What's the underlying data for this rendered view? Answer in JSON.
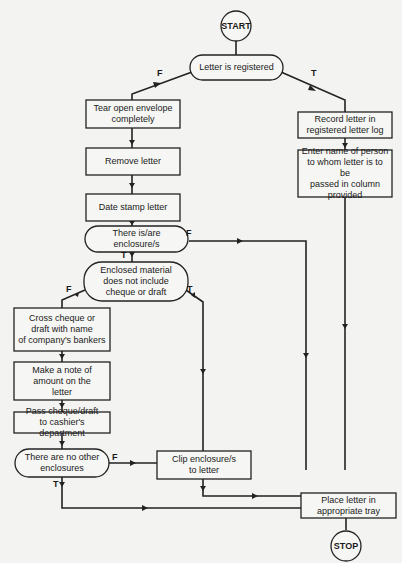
{
  "diagram": {
    "type": "flowchart",
    "terminals": {
      "start": "START",
      "stop": "STOP"
    },
    "nodes": {
      "letter_registered": {
        "kind": "decision",
        "lines": [
          "Letter is registered"
        ]
      },
      "tear_open": {
        "kind": "process",
        "lines": [
          "Tear open envelope",
          "completely"
        ]
      },
      "remove_letter": {
        "kind": "process",
        "lines": [
          "Remove letter"
        ]
      },
      "date_stamp": {
        "kind": "process",
        "lines": [
          "Date stamp letter"
        ]
      },
      "there_is_enclosure": {
        "kind": "decision",
        "lines": [
          "There is/are",
          "enclosure/s"
        ]
      },
      "no_cheque": {
        "kind": "decision",
        "lines": [
          "Enclosed material",
          "does not include",
          "cheque or draft"
        ]
      },
      "cross_cheque": {
        "kind": "process",
        "lines": [
          "Cross cheque or",
          "draft with name",
          "of company's bankers"
        ]
      },
      "note_amount": {
        "kind": "process",
        "lines": [
          "Make a note of",
          "amount on the",
          "letter"
        ]
      },
      "pass_cheque": {
        "kind": "process",
        "lines": [
          "Pass cheque/draft",
          "to cashier's department"
        ]
      },
      "no_other_enclosures": {
        "kind": "decision",
        "lines": [
          "There are no other",
          "enclosures"
        ]
      },
      "clip_enclosures": {
        "kind": "process",
        "lines": [
          "Clip enclosure/s",
          "to letter"
        ]
      },
      "record_letter": {
        "kind": "process",
        "lines": [
          "Record letter in",
          "registered letter log"
        ]
      },
      "enter_name": {
        "kind": "process",
        "lines": [
          "Enter name of person",
          "to whom letter is to be",
          "passed in column",
          "provided"
        ]
      },
      "place_letter": {
        "kind": "process",
        "lines": [
          "Place letter in",
          "appropriate tray"
        ]
      }
    },
    "branch_labels": {
      "true": "T",
      "false": "F"
    },
    "edges": [
      {
        "from": "start",
        "to": "letter_registered",
        "label": ""
      },
      {
        "from": "letter_registered",
        "to": "tear_open",
        "label": "F"
      },
      {
        "from": "letter_registered",
        "to": "record_letter",
        "label": "T"
      },
      {
        "from": "tear_open",
        "to": "remove_letter",
        "label": ""
      },
      {
        "from": "remove_letter",
        "to": "date_stamp",
        "label": ""
      },
      {
        "from": "date_stamp",
        "to": "there_is_enclosure",
        "label": ""
      },
      {
        "from": "there_is_enclosure",
        "to": "no_cheque",
        "label": "T"
      },
      {
        "from": "there_is_enclosure",
        "to": "place_letter",
        "label": "F"
      },
      {
        "from": "no_cheque",
        "to": "cross_cheque",
        "label": "F"
      },
      {
        "from": "no_cheque",
        "to": "place_letter",
        "label": "T"
      },
      {
        "from": "cross_cheque",
        "to": "note_amount",
        "label": ""
      },
      {
        "from": "note_amount",
        "to": "pass_cheque",
        "label": ""
      },
      {
        "from": "pass_cheque",
        "to": "no_other_enclosures",
        "label": ""
      },
      {
        "from": "no_other_enclosures",
        "to": "clip_enclosures",
        "label": "F"
      },
      {
        "from": "no_other_enclosures",
        "to": "place_letter",
        "label": "T"
      },
      {
        "from": "clip_enclosures",
        "to": "place_letter",
        "label": ""
      },
      {
        "from": "record_letter",
        "to": "enter_name",
        "label": ""
      },
      {
        "from": "enter_name",
        "to": "place_letter",
        "label": ""
      },
      {
        "from": "place_letter",
        "to": "stop",
        "label": ""
      }
    ]
  }
}
